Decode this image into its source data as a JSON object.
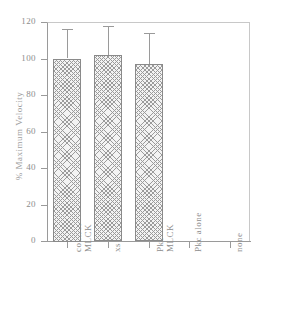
{
  "chart_data": {
    "type": "bar",
    "title": "",
    "xlabel": "",
    "ylabel": "% Maximum Velocity",
    "categories": [
      "control\nMLCK",
      "xs MLCK",
      "Pkc +\nMLCK",
      "Pkc alone",
      "none"
    ],
    "values": [
      100,
      102,
      97,
      0,
      0
    ],
    "errors": [
      16,
      16,
      17,
      0,
      0
    ],
    "ylim": [
      0,
      120
    ],
    "yticks": [
      0,
      20,
      40,
      60,
      80,
      100,
      120
    ],
    "ytick_labels": [
      "0",
      "20",
      "40",
      "60",
      "80",
      "100",
      "120"
    ],
    "grid": false,
    "legend": "none",
    "bar_fill": "cross-hatch",
    "bar_color": "#f3f3f3",
    "line_color": "#9a9a9a",
    "text_color": "#8d8d8d"
  }
}
